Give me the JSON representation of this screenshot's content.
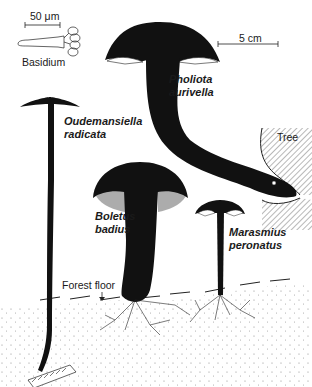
{
  "scale_bars": {
    "micro": "50 μm",
    "macro": "5 cm"
  },
  "labels": {
    "basidium": "Basidium",
    "tree": "Tree",
    "forest_floor": "Forest floor"
  },
  "species": [
    {
      "genus": "Pholiota",
      "epithet": "aurivella"
    },
    {
      "genus": "Oudemansiella",
      "epithet": "radicata"
    },
    {
      "genus": "Boletus",
      "epithet": "badius"
    },
    {
      "genus": "Marasmius",
      "epithet": "peronatus"
    }
  ],
  "colors": {
    "ink": "#111111",
    "paper": "#ffffff",
    "soil_dots": "#777777"
  }
}
